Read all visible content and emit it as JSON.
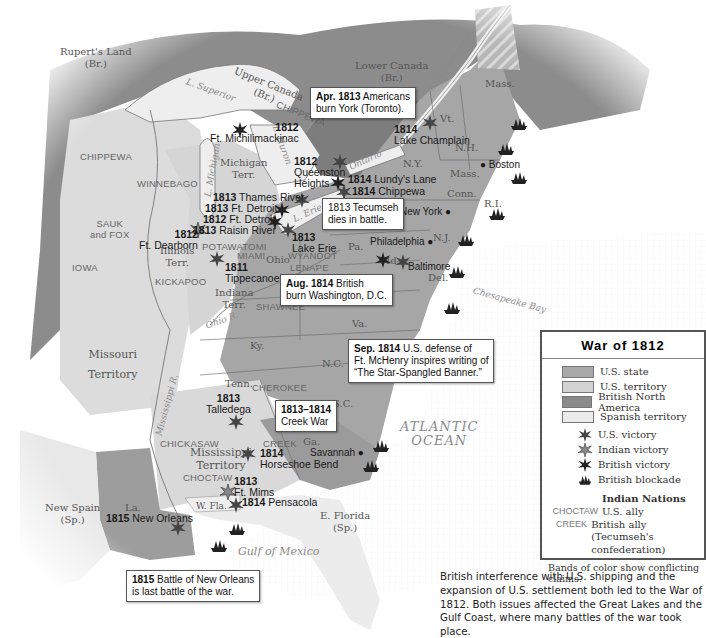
{
  "title": "War of 1812",
  "legend": {
    "title": "War of 1812",
    "territory_types": [
      {
        "label": "U.S. state",
        "color": "#a9a9a9"
      },
      {
        "label": "U.S. territory",
        "color": "#d2d2d2"
      },
      {
        "label": "British North America",
        "color": "#8a8a8a"
      },
      {
        "label": "Spanish territory",
        "color": "#ececec"
      }
    ],
    "symbols": [
      {
        "label": "U.S. victory",
        "icon": "us-victory-icon"
      },
      {
        "label": "Indian victory",
        "icon": "indian-victory-icon"
      },
      {
        "label": "British victory",
        "icon": "british-victory-icon"
      },
      {
        "label": "British blockade",
        "icon": "british-blockade-icon"
      }
    ],
    "indian_nations_heading": "Indian Nations",
    "indian_nations": [
      {
        "key": "CHOCTAW",
        "label": "U.S. ally"
      },
      {
        "key": "CREEK",
        "label": "British ally",
        "sublabel": "(Tecumseh's confederation)"
      }
    ],
    "footnote": "Bands of color show conflicting claims."
  },
  "caption": "British interference with U.S. shipping and the expansion of U.S. settlement both led to the War of 1812. Both issues affected the Great Lakes and the Gulf Coast, where many battles of the war took place.",
  "regions": {
    "ruperts_land": [
      "Rupert's Land",
      "(Br.)"
    ],
    "upper_canada": [
      "Upper Canada",
      "(Br.)"
    ],
    "lower_canada": [
      "Lower Canada",
      "(Br.)"
    ],
    "michigan_terr": [
      "Michigan",
      "Terr."
    ],
    "illinois_terr": [
      "Illinois",
      "Terr."
    ],
    "indiana_terr": [
      "Indiana",
      "Terr."
    ],
    "missouri_terr": [
      "Missouri",
      "Territory"
    ],
    "mississippi_terr": [
      "Mississippi",
      "Territory"
    ],
    "new_spain": [
      "New Spain",
      "(Sp.)"
    ],
    "e_florida": [
      "E. Florida",
      "(Sp.)"
    ],
    "w_fla": "W. Fla.",
    "states": {
      "mass_north": "Mass.",
      "vt": "Vt.",
      "nh": "N.H.",
      "ny": "N.Y.",
      "mass": "Mass.",
      "conn": "Conn.",
      "ri": "R.I.",
      "nj": "N.J.",
      "pa": "Pa.",
      "ohio": "Ohio",
      "md": "Md.",
      "del": "Del.",
      "va": "Va.",
      "ky": "Ky.",
      "nc": "N.C.",
      "tenn": "Tenn.",
      "sc": "S.C.",
      "ga": "Ga.",
      "la": "La."
    }
  },
  "nations": {
    "chippewa_east": "CHIPPEWA",
    "chippewa_west": "CHIPPEWA",
    "winnebago": "WINNEBAGO",
    "sauk_fox": [
      "SAUK",
      "and FOX"
    ],
    "iowa": "IOWA",
    "kickapoo": "KICKAPOO",
    "potawatomi": "POTAWATOMI",
    "miami": "MIAMI",
    "wyandot": "WYANDOT",
    "lenape": "LENAPE",
    "shawnee": "SHAWNEE",
    "cherokee": "CHEROKEE",
    "chickasaw": "CHICKASAW",
    "choctaw": "CHOCTAW",
    "creek": "CREEK"
  },
  "water": {
    "l_superior": "L. Superior",
    "l_michigan": "L. Michigan",
    "l_huron": "L. Huron",
    "l_erie": "L. Erie",
    "ontario": "Ontario",
    "st_lawrence": "St. Lawrence R.",
    "ohio_r": "Ohio R.",
    "mississippi_r": "Mississippi R.",
    "chesapeake": "Chesapeake Bay",
    "atlantic": [
      "ATLANTIC",
      "OCEAN"
    ],
    "gulf": "Gulf of Mexico"
  },
  "cities": {
    "boston": "Boston",
    "new_york": "New York",
    "philadelphia": "Philadelphia",
    "baltimore": "Baltimore",
    "savannah": "Savannah"
  },
  "battles": [
    {
      "year": "1812",
      "name": "Ft. Michilimackinac",
      "type": "british"
    },
    {
      "year": "1812",
      "name": "Queenston Heights",
      "type": "british"
    },
    {
      "year": "1814",
      "name": "Lundy's Lane",
      "type": "british"
    },
    {
      "year": "1814",
      "name": "Chippewa",
      "type": "us"
    },
    {
      "year": "1814",
      "name": "Lake Champlain",
      "type": "us"
    },
    {
      "year": "1813",
      "name": "Thames River",
      "type": "us"
    },
    {
      "year": "1813",
      "name": "Ft. Detroit",
      "type": "us"
    },
    {
      "year": "1812",
      "name": "Ft. Detroit",
      "type": "british"
    },
    {
      "year": "1813",
      "name": "Raisin River",
      "type": "british"
    },
    {
      "year": "1812",
      "name": "Ft. Dearborn",
      "type": "indian"
    },
    {
      "year": "1813",
      "name": "Lake Erie",
      "type": "us"
    },
    {
      "year": "1811",
      "name": "Tippecanoe",
      "type": "us"
    },
    {
      "year": "1813",
      "name": "Talledega",
      "type": "us"
    },
    {
      "year": "1814",
      "name": "Horseshoe Bend",
      "type": "us"
    },
    {
      "year": "1813",
      "name": "Ft. Mims",
      "type": "indian"
    },
    {
      "year": "1814",
      "name": "Pensacola",
      "type": "us"
    },
    {
      "year": "1815",
      "name": "New Orleans",
      "type": "us"
    }
  ],
  "callouts": {
    "york": {
      "year": "Apr. 1813",
      "text1": "Americans",
      "text2": "burn York (Toronto)."
    },
    "tecumseh": {
      "year": "1813",
      "text1": "Tecumseh",
      "text2": "dies in battle."
    },
    "washington": {
      "year": "Aug. 1814",
      "text1": "British",
      "text2": "burn Washington, D.C."
    },
    "mchenry": {
      "year": "Sep. 1814",
      "text1": "U.S. defense of",
      "text2": "Ft. McHenry inspires writing of",
      "text3": "“The Star-Spangled Banner.”"
    },
    "creek_war": {
      "year": "1813–1814",
      "text1": "Creek War"
    },
    "new_orleans": {
      "year": "1815",
      "text1": "Battle of New Orleans",
      "text2": "is last battle of the war."
    }
  }
}
